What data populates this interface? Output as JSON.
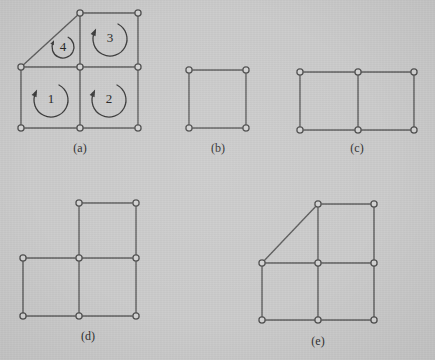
{
  "figure": {
    "background_color": "#cacaca",
    "edge_color": "#5c5c5c",
    "vertex_fill_color": "#d3d3d3",
    "vertex_stroke_color": "#4f4f4f",
    "arrow_color": "#3a3a3a",
    "label_color": "#2c2c2c",
    "width": 435,
    "height": 360
  },
  "panels": [
    {
      "id": "a",
      "caption": "(a)",
      "caption_x": 80,
      "caption_y": 152,
      "vertices": [
        {
          "name": "a-v-top-left",
          "x": 80,
          "y": 13
        },
        {
          "name": "a-v-top-right",
          "x": 138,
          "y": 13
        },
        {
          "name": "a-v-mid-left",
          "x": 21,
          "y": 67
        },
        {
          "name": "a-v-mid-center",
          "x": 80,
          "y": 67
        },
        {
          "name": "a-v-mid-right",
          "x": 138,
          "y": 67
        },
        {
          "name": "a-v-bottom-left",
          "x": 21,
          "y": 128
        },
        {
          "name": "a-v-bottom-center",
          "x": 80,
          "y": 128
        },
        {
          "name": "a-v-bottom-right",
          "x": 138,
          "y": 128
        }
      ],
      "edges": [
        {
          "name": "a-edge-top",
          "x1": 80,
          "y1": 13,
          "x2": 138,
          "y2": 13
        },
        {
          "name": "a-edge-diagonal",
          "x1": 80,
          "y1": 13,
          "x2": 21,
          "y2": 67
        },
        {
          "name": "a-edge-upper-vertical-center",
          "x1": 80,
          "y1": 13,
          "x2": 80,
          "y2": 67
        },
        {
          "name": "a-edge-upper-vertical-right",
          "x1": 138,
          "y1": 13,
          "x2": 138,
          "y2": 67
        },
        {
          "name": "a-edge-middle-horizontal-left",
          "x1": 21,
          "y1": 67,
          "x2": 80,
          "y2": 67
        },
        {
          "name": "a-edge-middle-horizontal-right",
          "x1": 80,
          "y1": 67,
          "x2": 138,
          "y2": 67
        },
        {
          "name": "a-edge-lower-vertical-left",
          "x1": 21,
          "y1": 67,
          "x2": 21,
          "y2": 128
        },
        {
          "name": "a-edge-lower-vertical-center",
          "x1": 80,
          "y1": 67,
          "x2": 80,
          "y2": 128
        },
        {
          "name": "a-edge-lower-vertical-right",
          "x1": 138,
          "y1": 67,
          "x2": 138,
          "y2": 128
        },
        {
          "name": "a-edge-bottom-left",
          "x1": 21,
          "y1": 128,
          "x2": 80,
          "y2": 128
        },
        {
          "name": "a-edge-bottom-right",
          "x1": 80,
          "y1": 128,
          "x2": 138,
          "y2": 128
        }
      ],
      "face_labels": [
        {
          "name": "face-label-1",
          "text": "1",
          "x": 51,
          "y": 100
        },
        {
          "name": "face-label-2",
          "text": "2",
          "x": 109,
          "y": 100
        },
        {
          "name": "face-label-3",
          "text": "3",
          "x": 110,
          "y": 39
        },
        {
          "name": "face-label-4",
          "text": "4",
          "x": 63,
          "y": 48
        }
      ],
      "rotation_arrows": [
        {
          "name": "rotation-arrow-face-1",
          "cx": 51,
          "cy": 100,
          "r": 17,
          "direction": "counterclockwise"
        },
        {
          "name": "rotation-arrow-face-2",
          "cx": 109,
          "cy": 100,
          "r": 17,
          "direction": "counterclockwise"
        },
        {
          "name": "rotation-arrow-face-3",
          "cx": 110,
          "cy": 39,
          "r": 17,
          "direction": "counterclockwise"
        },
        {
          "name": "rotation-arrow-face-4",
          "cx": 63,
          "cy": 47,
          "r": 11,
          "direction": "counterclockwise"
        }
      ]
    },
    {
      "id": "b",
      "caption": "(b)",
      "caption_x": 218,
      "caption_y": 152,
      "vertices": [
        {
          "name": "b-v-top-left",
          "x": 189,
          "y": 70
        },
        {
          "name": "b-v-top-right",
          "x": 246,
          "y": 70
        },
        {
          "name": "b-v-bottom-left",
          "x": 189,
          "y": 128
        },
        {
          "name": "b-v-bottom-right",
          "x": 246,
          "y": 128
        }
      ],
      "edges": [
        {
          "name": "b-edge-top",
          "x1": 189,
          "y1": 70,
          "x2": 246,
          "y2": 70
        },
        {
          "name": "b-edge-left",
          "x1": 189,
          "y1": 70,
          "x2": 189,
          "y2": 128
        },
        {
          "name": "b-edge-right",
          "x1": 246,
          "y1": 70,
          "x2": 246,
          "y2": 128
        },
        {
          "name": "b-edge-bottom",
          "x1": 189,
          "y1": 128,
          "x2": 246,
          "y2": 128
        }
      ],
      "face_labels": [],
      "rotation_arrows": []
    },
    {
      "id": "c",
      "caption": "(c)",
      "caption_x": 357,
      "caption_y": 152,
      "vertices": [
        {
          "name": "c-v-top-left",
          "x": 300,
          "y": 72
        },
        {
          "name": "c-v-top-center",
          "x": 358,
          "y": 72
        },
        {
          "name": "c-v-top-right",
          "x": 414,
          "y": 72
        },
        {
          "name": "c-v-bottom-left",
          "x": 300,
          "y": 130
        },
        {
          "name": "c-v-bottom-center",
          "x": 358,
          "y": 130
        },
        {
          "name": "c-v-bottom-right",
          "x": 414,
          "y": 130
        }
      ],
      "edges": [
        {
          "name": "c-edge-top-left",
          "x1": 300,
          "y1": 72,
          "x2": 358,
          "y2": 72
        },
        {
          "name": "c-edge-top-right",
          "x1": 358,
          "y1": 72,
          "x2": 414,
          "y2": 72
        },
        {
          "name": "c-edge-vertical-left",
          "x1": 300,
          "y1": 72,
          "x2": 300,
          "y2": 130
        },
        {
          "name": "c-edge-vertical-center",
          "x1": 358,
          "y1": 72,
          "x2": 358,
          "y2": 130
        },
        {
          "name": "c-edge-vertical-right",
          "x1": 414,
          "y1": 72,
          "x2": 414,
          "y2": 130
        },
        {
          "name": "c-edge-bottom-left",
          "x1": 300,
          "y1": 130,
          "x2": 358,
          "y2": 130
        },
        {
          "name": "c-edge-bottom-right",
          "x1": 358,
          "y1": 130,
          "x2": 414,
          "y2": 130
        }
      ],
      "face_labels": [],
      "rotation_arrows": []
    },
    {
      "id": "d",
      "caption": "(d)",
      "caption_x": 88,
      "caption_y": 340,
      "vertices": [
        {
          "name": "d-v-top-center",
          "x": 79,
          "y": 203
        },
        {
          "name": "d-v-top-right",
          "x": 136,
          "y": 203
        },
        {
          "name": "d-v-mid-left",
          "x": 23,
          "y": 258
        },
        {
          "name": "d-v-mid-center",
          "x": 79,
          "y": 258
        },
        {
          "name": "d-v-mid-right",
          "x": 136,
          "y": 258
        },
        {
          "name": "d-v-bottom-left",
          "x": 23,
          "y": 316
        },
        {
          "name": "d-v-bottom-center",
          "x": 79,
          "y": 316
        },
        {
          "name": "d-v-bottom-right",
          "x": 136,
          "y": 316
        }
      ],
      "edges": [
        {
          "name": "d-edge-top",
          "x1": 79,
          "y1": 203,
          "x2": 136,
          "y2": 203
        },
        {
          "name": "d-edge-upper-vertical-center",
          "x1": 79,
          "y1": 203,
          "x2": 79,
          "y2": 258
        },
        {
          "name": "d-edge-upper-vertical-right",
          "x1": 136,
          "y1": 203,
          "x2": 136,
          "y2": 258
        },
        {
          "name": "d-edge-middle-horizontal-left",
          "x1": 23,
          "y1": 258,
          "x2": 79,
          "y2": 258
        },
        {
          "name": "d-edge-middle-horizontal-right",
          "x1": 79,
          "y1": 258,
          "x2": 136,
          "y2": 258
        },
        {
          "name": "d-edge-lower-vertical-left",
          "x1": 23,
          "y1": 258,
          "x2": 23,
          "y2": 316
        },
        {
          "name": "d-edge-lower-vertical-center",
          "x1": 79,
          "y1": 258,
          "x2": 79,
          "y2": 316
        },
        {
          "name": "d-edge-lower-vertical-right",
          "x1": 136,
          "y1": 258,
          "x2": 136,
          "y2": 316
        },
        {
          "name": "d-edge-bottom-left",
          "x1": 23,
          "y1": 316,
          "x2": 79,
          "y2": 316
        },
        {
          "name": "d-edge-bottom-right",
          "x1": 79,
          "y1": 316,
          "x2": 136,
          "y2": 316
        }
      ],
      "face_labels": [],
      "rotation_arrows": []
    },
    {
      "id": "e",
      "caption": "(e)",
      "caption_x": 318,
      "caption_y": 345,
      "vertices": [
        {
          "name": "e-v-top-center",
          "x": 318,
          "y": 204
        },
        {
          "name": "e-v-top-right",
          "x": 374,
          "y": 204
        },
        {
          "name": "e-v-mid-left",
          "x": 262,
          "y": 263
        },
        {
          "name": "e-v-mid-center",
          "x": 318,
          "y": 263
        },
        {
          "name": "e-v-mid-right",
          "x": 374,
          "y": 263
        },
        {
          "name": "e-v-bottom-left",
          "x": 262,
          "y": 320
        },
        {
          "name": "e-v-bottom-center",
          "x": 318,
          "y": 320
        },
        {
          "name": "e-v-bottom-right",
          "x": 374,
          "y": 320
        }
      ],
      "edges": [
        {
          "name": "e-edge-top",
          "x1": 318,
          "y1": 204,
          "x2": 374,
          "y2": 204
        },
        {
          "name": "e-edge-diagonal",
          "x1": 318,
          "y1": 204,
          "x2": 262,
          "y2": 263
        },
        {
          "name": "e-edge-upper-vertical-center",
          "x1": 318,
          "y1": 204,
          "x2": 318,
          "y2": 263
        },
        {
          "name": "e-edge-upper-vertical-right",
          "x1": 374,
          "y1": 204,
          "x2": 374,
          "y2": 263
        },
        {
          "name": "e-edge-middle-horizontal-left",
          "x1": 262,
          "y1": 263,
          "x2": 318,
          "y2": 263
        },
        {
          "name": "e-edge-middle-horizontal-right",
          "x1": 318,
          "y1": 263,
          "x2": 374,
          "y2": 263
        },
        {
          "name": "e-edge-lower-vertical-left",
          "x1": 262,
          "y1": 263,
          "x2": 262,
          "y2": 320
        },
        {
          "name": "e-edge-lower-vertical-center",
          "x1": 318,
          "y1": 263,
          "x2": 318,
          "y2": 320
        },
        {
          "name": "e-edge-lower-vertical-right",
          "x1": 374,
          "y1": 263,
          "x2": 374,
          "y2": 320
        },
        {
          "name": "e-edge-bottom-left",
          "x1": 262,
          "y1": 320,
          "x2": 318,
          "y2": 320
        },
        {
          "name": "e-edge-bottom-right",
          "x1": 318,
          "y1": 320,
          "x2": 374,
          "y2": 320
        }
      ],
      "face_labels": [],
      "rotation_arrows": []
    }
  ]
}
